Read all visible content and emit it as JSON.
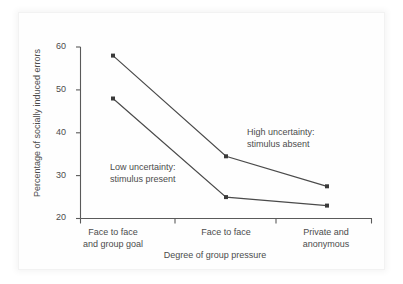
{
  "chart_data": {
    "type": "line",
    "title": "",
    "subtitle": "",
    "xlabel": "Degree of group pressure",
    "ylabel": "Percentage of socially induced errors",
    "categories": [
      "Face to face and group goal",
      "Face to face",
      "Private and anonymous"
    ],
    "category_lines": [
      [
        "Face to face",
        "and group goal"
      ],
      [
        "Face to face",
        ""
      ],
      [
        "Private and",
        "anonymous"
      ]
    ],
    "ylim": [
      20,
      60
    ],
    "yticks": [
      20,
      30,
      40,
      50,
      60
    ],
    "ytick_labels": [
      "20",
      "30",
      "40",
      "50",
      "60"
    ],
    "grid": false,
    "legend": "none",
    "series": [
      {
        "name": "High uncertainty: stimulus absent",
        "values": [
          58,
          34.5,
          27.5
        ],
        "color": "#4a4a4a",
        "marker": "square"
      },
      {
        "name": "Low uncertainty: stimulus present",
        "values": [
          48,
          25,
          23
        ],
        "color": "#4a4a4a",
        "marker": "square"
      }
    ],
    "annotations": [
      {
        "id": "low-uncertainty",
        "line1": "Low uncertainty:",
        "line2": "stimulus present"
      },
      {
        "id": "high-uncertainty",
        "line1": "High uncertainty:",
        "line2": "stimulus absent"
      }
    ],
    "axis_color": "#5a5a5a",
    "text_color": "#4c4c4c",
    "background": "#ffffff"
  }
}
